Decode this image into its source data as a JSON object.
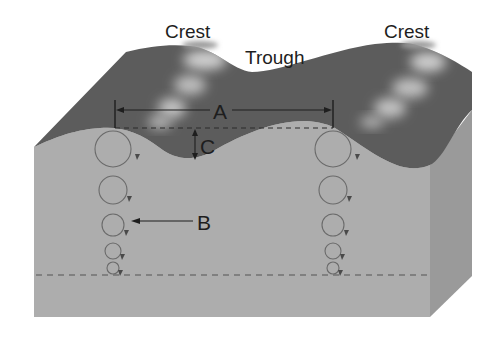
{
  "diagram": {
    "labels": {
      "crest_left": "Crest",
      "crest_right": "Crest",
      "trough": "Trough",
      "a": "A",
      "b": "B",
      "c": "C"
    },
    "elements": {
      "wavelength_dimension": "A",
      "orbital_circles_pointer": "B",
      "wave_height_dimension": "C"
    },
    "colors": {
      "water_surface": "#5c5c5c",
      "water_surface_highlight": "#b8b8b8",
      "front_face": "#adadad",
      "side_face": "#9a9a9a",
      "orbit_stroke": "#6a6a6a",
      "arrow": "#1e1e1e",
      "dashed": "#555555",
      "background": "#ffffff"
    },
    "orbit_columns": [
      {
        "cx": 113,
        "circles": [
          {
            "cy": 149,
            "r": 18
          },
          {
            "cy": 190,
            "r": 14
          },
          {
            "cy": 225,
            "r": 11
          },
          {
            "cy": 251,
            "r": 8
          },
          {
            "cy": 268,
            "r": 6
          }
        ]
      },
      {
        "cx": 333,
        "circles": [
          {
            "cy": 149,
            "r": 18
          },
          {
            "cy": 190,
            "r": 14
          },
          {
            "cy": 225,
            "r": 11
          },
          {
            "cy": 251,
            "r": 8
          },
          {
            "cy": 268,
            "r": 6
          }
        ]
      }
    ]
  }
}
